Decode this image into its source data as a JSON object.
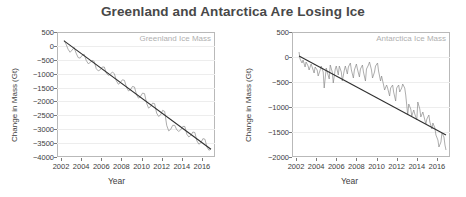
{
  "figure": {
    "title": "Greenland and Antarctica Are Losing Ice",
    "background": "#ffffff",
    "title_color": "#484848"
  },
  "chart_data": [
    {
      "type": "line",
      "title": "Greenland Ice Mass",
      "panel": "left",
      "xlabel": "Year",
      "ylabel": "Change in Mass (Gt)",
      "xlim": [
        2001.6,
        2017.3
      ],
      "ylim": [
        -4000,
        500
      ],
      "xticks": [
        2002,
        2004,
        2006,
        2008,
        2010,
        2012,
        2014,
        2016
      ],
      "yticks": [
        500,
        0,
        -500,
        -1000,
        -1500,
        -2000,
        -2500,
        -3000,
        -3500,
        -4000
      ],
      "grid": true,
      "legend": "none",
      "series": [
        {
          "name": "Greenland ice mass anomaly",
          "color": "#8a8a8a",
          "x": [
            2002.3,
            2002.5,
            2002.7,
            2002.9,
            2003.1,
            2003.3,
            2003.5,
            2003.7,
            2003.9,
            2004.1,
            2004.3,
            2004.5,
            2004.7,
            2004.9,
            2005.1,
            2005.3,
            2005.5,
            2005.7,
            2005.9,
            2006.1,
            2006.3,
            2006.5,
            2006.7,
            2006.9,
            2007.1,
            2007.3,
            2007.5,
            2007.7,
            2007.9,
            2008.1,
            2008.3,
            2008.5,
            2008.7,
            2008.9,
            2009.1,
            2009.3,
            2009.5,
            2009.7,
            2009.9,
            2010.1,
            2010.3,
            2010.5,
            2010.7,
            2010.9,
            2011.1,
            2011.3,
            2011.5,
            2011.7,
            2011.9,
            2012.1,
            2012.3,
            2012.5,
            2012.7,
            2012.9,
            2013.1,
            2013.3,
            2013.5,
            2013.7,
            2013.9,
            2014.1,
            2014.3,
            2014.5,
            2014.7,
            2014.9,
            2015.1,
            2015.3,
            2015.5,
            2015.7,
            2015.9,
            2016.1,
            2016.3,
            2016.5,
            2016.7,
            2016.9
          ],
          "y": [
            210,
            60,
            -120,
            -230,
            -150,
            -60,
            -260,
            -420,
            -440,
            -340,
            -300,
            -520,
            -640,
            -600,
            -520,
            -560,
            -820,
            -900,
            -860,
            -760,
            -760,
            -980,
            -1060,
            -1020,
            -940,
            -1000,
            -1260,
            -1380,
            -1320,
            -1220,
            -1240,
            -1480,
            -1620,
            -1580,
            -1460,
            -1480,
            -1760,
            -1880,
            -1820,
            -1700,
            -1720,
            -2060,
            -2240,
            -2180,
            -2060,
            -2080,
            -2420,
            -2540,
            -2480,
            -2320,
            -2360,
            -2860,
            -3060,
            -3000,
            -2860,
            -2860,
            -3020,
            -3080,
            -3020,
            -2900,
            -2900,
            -3180,
            -3280,
            -3220,
            -3100,
            -3120,
            -3420,
            -3540,
            -3480,
            -3340,
            -3360,
            -3640,
            -3760,
            -3700
          ]
        },
        {
          "name": "Linear trend",
          "color": "#2f2f2f",
          "x": [
            2002.3,
            2016.9
          ],
          "y": [
            180,
            -3720
          ]
        }
      ]
    },
    {
      "type": "line",
      "title": "Antarctica Ice Mass",
      "panel": "right",
      "xlabel": "Year",
      "ylabel": "Change in Mass (Gt)",
      "xlim": [
        2001.6,
        2017.3
      ],
      "ylim": [
        -2000,
        500
      ],
      "xticks": [
        2002,
        2004,
        2006,
        2008,
        2010,
        2012,
        2014,
        2016
      ],
      "yticks": [
        500,
        0,
        -500,
        -1000,
        -1500,
        -2000
      ],
      "grid": true,
      "legend": "none",
      "series": [
        {
          "name": "Antarctica ice mass anomaly",
          "color": "#8a8a8a",
          "x": [
            2002.3,
            2002.4,
            2002.6,
            2002.7,
            2002.9,
            2003.0,
            2003.2,
            2003.3,
            2003.5,
            2003.6,
            2003.8,
            2003.9,
            2004.1,
            2004.2,
            2004.4,
            2004.5,
            2004.7,
            2004.8,
            2005.0,
            2005.1,
            2005.3,
            2005.4,
            2005.6,
            2005.7,
            2005.9,
            2006.0,
            2006.2,
            2006.3,
            2006.5,
            2006.6,
            2006.8,
            2006.9,
            2007.1,
            2007.2,
            2007.4,
            2007.5,
            2007.7,
            2007.8,
            2008.0,
            2008.1,
            2008.3,
            2008.4,
            2008.6,
            2008.7,
            2008.9,
            2009.0,
            2009.2,
            2009.3,
            2009.5,
            2009.6,
            2009.8,
            2009.9,
            2010.1,
            2010.2,
            2010.4,
            2010.5,
            2010.7,
            2010.8,
            2011.0,
            2011.1,
            2011.3,
            2011.4,
            2011.6,
            2011.7,
            2011.9,
            2012.0,
            2012.2,
            2012.3,
            2012.5,
            2012.6,
            2012.8,
            2012.9,
            2013.1,
            2013.2,
            2013.4,
            2013.5,
            2013.7,
            2013.8,
            2014.0,
            2014.1,
            2014.3,
            2014.4,
            2014.6,
            2014.7,
            2014.9,
            2015.0,
            2015.2,
            2015.3,
            2015.5,
            2015.6,
            2015.8,
            2015.9,
            2016.1,
            2016.2,
            2016.4,
            2016.5,
            2016.7,
            2016.8,
            2016.9
          ],
          "y": [
            100,
            -40,
            -120,
            -60,
            -200,
            -100,
            -180,
            -260,
            -140,
            -200,
            -320,
            -200,
            -260,
            -380,
            -260,
            -180,
            -300,
            -620,
            -220,
            -300,
            -440,
            -160,
            -300,
            -520,
            -240,
            -180,
            -360,
            -180,
            -300,
            -480,
            -260,
            -180,
            -340,
            -200,
            -120,
            -260,
            -420,
            -260,
            -140,
            -240,
            -400,
            -240,
            -160,
            -300,
            -480,
            -240,
            -160,
            -100,
            -260,
            -420,
            -300,
            -180,
            -120,
            -280,
            -480,
            -380,
            -560,
            -660,
            -560,
            -620,
            -780,
            -620,
            -560,
            -700,
            -880,
            -620,
            -560,
            -700,
            -620,
            -540,
            -620,
            -760,
            -1160,
            -940,
            -1040,
            -1180,
            -1060,
            -1140,
            -1260,
            -900,
            -1040,
            -1200,
            -1100,
            -1180,
            -1340,
            -1240,
            -1160,
            -1300,
            -1440,
            -1320,
            -1420,
            -1560,
            -1660,
            -1800,
            -1700,
            -1520,
            -1600,
            -1760,
            -1860
          ]
        },
        {
          "name": "Linear trend",
          "color": "#2f2f2f",
          "x": [
            2002.3,
            2016.9
          ],
          "y": [
            20,
            -1560
          ]
        }
      ]
    }
  ]
}
